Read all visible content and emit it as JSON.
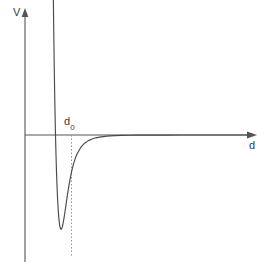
{
  "figure": {
    "title": "",
    "background_color": "#ffffff",
    "axis_color": "#555555",
    "curve_color": "#4a4a4a",
    "guide_color": "#9a9a9a",
    "label_color": "#3a3a3a"
  },
  "labels": {
    "y_axis": "V",
    "x_axis": "d",
    "minimum_marker": "d",
    "minimum_marker_sub": "0"
  },
  "chart_data": {
    "type": "line",
    "title": "",
    "xlabel": "d",
    "ylabel": "V",
    "grid": false,
    "legend": null,
    "annotations": [
      {
        "text": "d_0",
        "label": "d",
        "subscript": "0",
        "description": "equilibrium separation at the potential minimum",
        "x": 1.0,
        "y": 0.0,
        "guide": "dashed vertical line from x-axis down to curve minimum"
      }
    ],
    "axes": {
      "x_origin_px": 25,
      "y_zero_px": 135,
      "x_arrow_end_px": 256,
      "y_arrow_top_px": 9,
      "y_axis_bottom_px": 262,
      "xlim": [
        0,
        6.2
      ],
      "ylim": [
        -1.35,
        2.6
      ],
      "x_zero_crossing": 0.8909,
      "x_minimum": 1.0,
      "y_minimum": -1.0
    },
    "series": [
      {
        "name": "V(d)",
        "x": [
          0.735,
          0.745,
          0.755,
          0.765,
          0.775,
          0.785,
          0.795,
          0.805,
          0.815,
          0.825,
          0.835,
          0.845,
          0.855,
          0.865,
          0.875,
          0.885,
          0.895,
          0.905,
          0.915,
          0.925,
          0.935,
          0.945,
          0.955,
          0.965,
          0.975,
          0.985,
          0.995,
          1.005,
          1.015,
          1.03,
          1.05,
          1.07,
          1.09,
          1.11,
          1.14,
          1.17,
          1.2,
          1.25,
          1.3,
          1.35,
          1.4,
          1.5,
          1.6,
          1.7,
          1.8,
          1.9,
          2.0,
          2.2,
          2.4,
          2.6,
          2.8,
          3.0,
          3.4,
          3.8,
          4.2,
          4.6,
          5.0,
          5.4,
          5.8,
          6.0
        ],
        "y": [
          2.522,
          2.069,
          1.669,
          1.314,
          1.001,
          0.723,
          0.477,
          0.259,
          0.067,
          -0.103,
          -0.252,
          -0.383,
          -0.497,
          -0.596,
          -0.682,
          -0.755,
          -0.817,
          -0.868,
          -0.91,
          -0.943,
          -0.968,
          -0.986,
          -0.997,
          -1.001,
          -1.0,
          -0.995,
          -0.985,
          -0.971,
          -0.954,
          -0.924,
          -0.876,
          -0.824,
          -0.769,
          -0.714,
          -0.634,
          -0.559,
          -0.49,
          -0.39,
          -0.31,
          -0.248,
          -0.199,
          -0.13,
          -0.087,
          -0.06,
          -0.042,
          -0.03,
          -0.022,
          -0.012,
          -0.007,
          -0.004,
          -0.003,
          -0.002,
          -0.001,
          -0.0005,
          -0.0003,
          -0.0002,
          -0.0001,
          -0.0001,
          -5e-05,
          -5e-05
        ]
      }
    ]
  }
}
